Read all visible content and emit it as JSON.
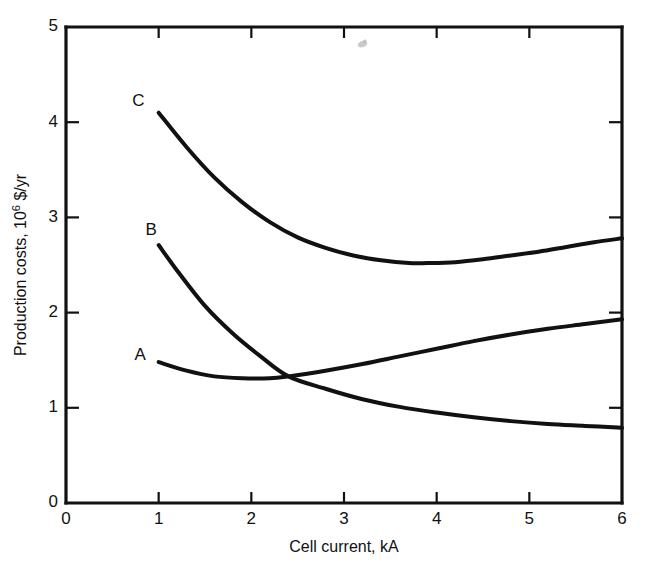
{
  "chart_data": {
    "type": "line",
    "title": "",
    "xlabel": "Cell current, kA",
    "ylabel": "Production costs, 10⁶ $/yr",
    "ylabel_base": "Production costs, 10",
    "ylabel_exponent": "6",
    "ylabel_tail": " $/yr",
    "xlim": [
      0,
      6
    ],
    "ylim": [
      0,
      5
    ],
    "grid": false,
    "legend": "inline-curve-labels",
    "xticks": [
      0,
      1,
      2,
      3,
      4,
      5,
      6
    ],
    "yticks": [
      0,
      1,
      2,
      3,
      4,
      5
    ],
    "xtick_labels": [
      "0",
      "1",
      "2",
      "3",
      "4",
      "5",
      "6"
    ],
    "ytick_labels": [
      "0",
      "1",
      "2",
      "3",
      "4",
      "5"
    ],
    "series": [
      {
        "name": "A",
        "label": "A",
        "label_x": 0.8,
        "label_y": 1.55,
        "x": [
          1.0,
          1.3,
          1.6,
          1.9,
          2.2,
          2.4,
          2.8,
          3.2,
          3.6,
          4.0,
          4.4,
          4.8,
          5.2,
          5.6,
          6.0
        ],
        "y": [
          1.48,
          1.39,
          1.33,
          1.31,
          1.31,
          1.33,
          1.39,
          1.46,
          1.54,
          1.62,
          1.7,
          1.77,
          1.83,
          1.88,
          1.93
        ]
      },
      {
        "name": "B",
        "label": "B",
        "label_x": 0.92,
        "label_y": 2.86,
        "x": [
          1.0,
          1.2,
          1.5,
          1.8,
          2.1,
          2.4,
          2.8,
          3.2,
          3.6,
          4.0,
          4.4,
          4.8,
          5.2,
          5.6,
          6.0
        ],
        "y": [
          2.71,
          2.44,
          2.07,
          1.78,
          1.54,
          1.33,
          1.2,
          1.09,
          1.01,
          0.95,
          0.9,
          0.86,
          0.83,
          0.81,
          0.79
        ]
      },
      {
        "name": "C",
        "label": "C",
        "label_x": 0.78,
        "label_y": 4.22,
        "x": [
          1.0,
          1.3,
          1.6,
          1.9,
          2.2,
          2.5,
          2.8,
          3.1,
          3.4,
          3.7,
          3.9,
          4.2,
          4.5,
          4.8,
          5.1,
          5.4,
          5.7,
          6.0
        ],
        "y": [
          4.1,
          3.74,
          3.42,
          3.16,
          2.95,
          2.79,
          2.68,
          2.6,
          2.55,
          2.52,
          2.52,
          2.53,
          2.56,
          2.6,
          2.64,
          2.69,
          2.74,
          2.78
        ]
      }
    ],
    "artifacts": [
      {
        "name": "ink-smudge",
        "x": 3.2,
        "y": 4.82
      }
    ],
    "colors": {
      "ink": "#111111",
      "background": "#ffffff"
    }
  }
}
